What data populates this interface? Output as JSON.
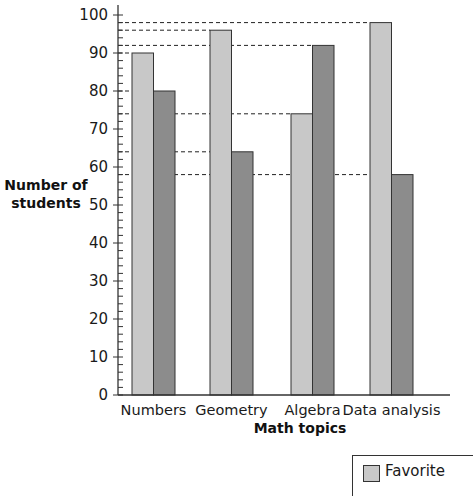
{
  "chart_data": {
    "type": "bar",
    "title": "",
    "xlabel": "Math topics",
    "ylabel": "Number of students",
    "ylim": [
      0,
      100
    ],
    "yticks": [
      0,
      10,
      20,
      30,
      40,
      50,
      60,
      70,
      80,
      90,
      100
    ],
    "minor_tick_step": 2,
    "grid": false,
    "categories": [
      "Numbers",
      "Geometry",
      "Algebra",
      "Data analysis"
    ],
    "series": [
      {
        "name": "Favorite",
        "color": "#c8c8c8",
        "values": [
          90,
          96,
          74,
          98
        ]
      },
      {
        "name": "Second series",
        "color": "#8c8c8c",
        "values": [
          80,
          64,
          92,
          58
        ]
      }
    ],
    "reference_lines": [
      98,
      96,
      92,
      90,
      80,
      74,
      64,
      58
    ],
    "legend": {
      "position": "bottom-right",
      "visible_entries": [
        "Favorite"
      ]
    }
  },
  "labels": {
    "ylabel_line1": "Number of",
    "ylabel_line2": "students",
    "xlabel": "Math topics",
    "legend_favorite": "Favorite"
  },
  "colors": {
    "favorite": "#c8c8c8",
    "second": "#8c8c8c",
    "axis": "#333333"
  }
}
